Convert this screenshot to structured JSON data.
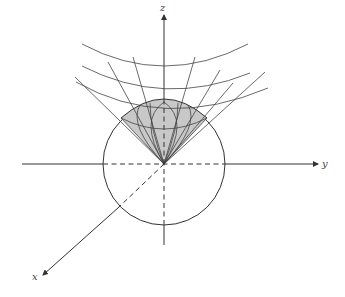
{
  "figure": {
    "axes": {
      "x": {
        "label": "x"
      },
      "y": {
        "label": "y"
      },
      "z": {
        "label": "z"
      }
    },
    "colors": {
      "stroke": "#333333",
      "shade": "#c8c8c8",
      "background": "#ffffff"
    },
    "elements": [
      "sphere-outline",
      "cone-surface",
      "level-curves",
      "radial-lines",
      "shaded-region"
    ]
  }
}
